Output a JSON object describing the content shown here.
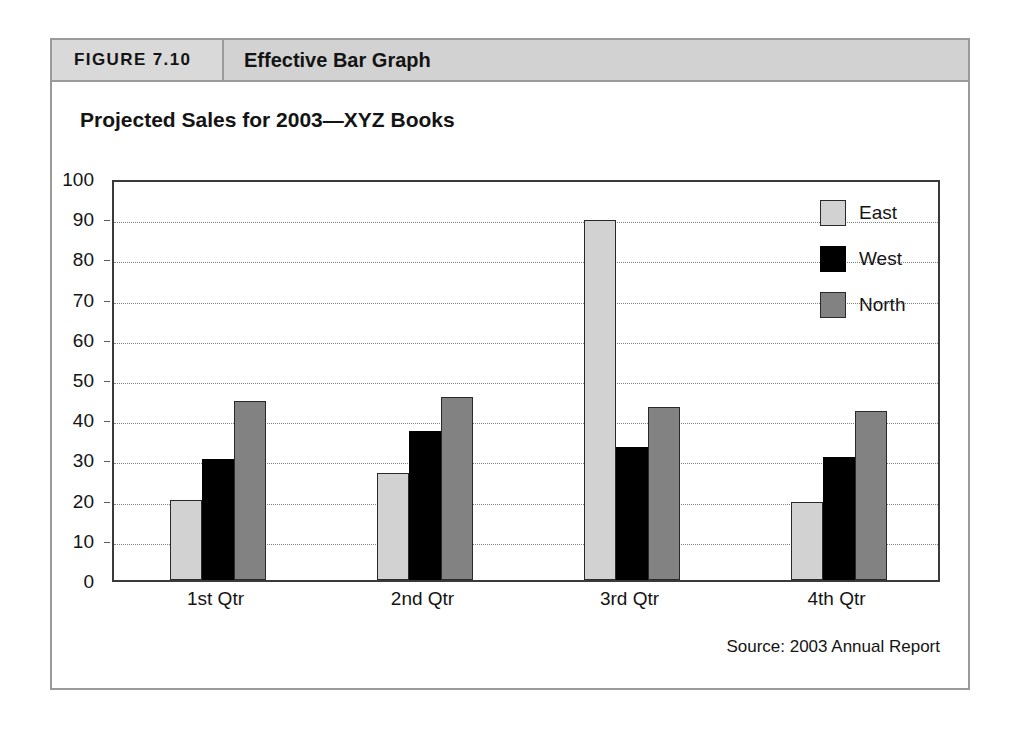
{
  "figure": {
    "number_label": "FIGURE 7.10",
    "caption": "Effective Bar Graph"
  },
  "source_note": "Source: 2003 Annual Report",
  "chart_data": {
    "type": "bar",
    "title": "Projected Sales for 2003—XYZ Books",
    "xlabel": "",
    "ylabel": "",
    "ylim": [
      0,
      100
    ],
    "ytick_step": 10,
    "yticks": [
      "0",
      "10",
      "20",
      "30",
      "40",
      "50",
      "60",
      "70",
      "80",
      "90",
      "100"
    ],
    "grid": true,
    "legend_position": "top-right inside plot",
    "categories": [
      "1st Qtr",
      "2nd Qtr",
      "3rd Qtr",
      "4th Qtr"
    ],
    "series": [
      {
        "name": "East",
        "color": "#d2d2d2",
        "values": [
          20.0,
          26.5,
          89.5,
          19.5
        ]
      },
      {
        "name": "West",
        "color": "#000000",
        "values": [
          30.0,
          37.0,
          33.0,
          30.5
        ]
      },
      {
        "name": "North",
        "color": "#828282",
        "values": [
          44.5,
          45.5,
          43.0,
          42.0
        ]
      }
    ]
  }
}
